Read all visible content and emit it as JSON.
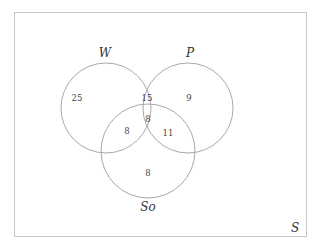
{
  "diagram": {
    "type": "venn-3",
    "universal_set": {
      "label": "S"
    },
    "sets": [
      {
        "id": "W",
        "label": "W"
      },
      {
        "id": "P",
        "label": "P"
      },
      {
        "id": "So",
        "label": "So"
      }
    ],
    "regions": {
      "W_only": "25",
      "P_only": "9",
      "So_only": "8",
      "W_and_P_only": "15",
      "W_and_So_only": "8",
      "P_and_So_only": "11",
      "W_and_P_and_So": "8"
    },
    "colors": {
      "circle_stroke": "#a9a9a9",
      "frame_stroke": "#c8c8c8",
      "text": "#444444",
      "background": "#ffffff"
    }
  }
}
